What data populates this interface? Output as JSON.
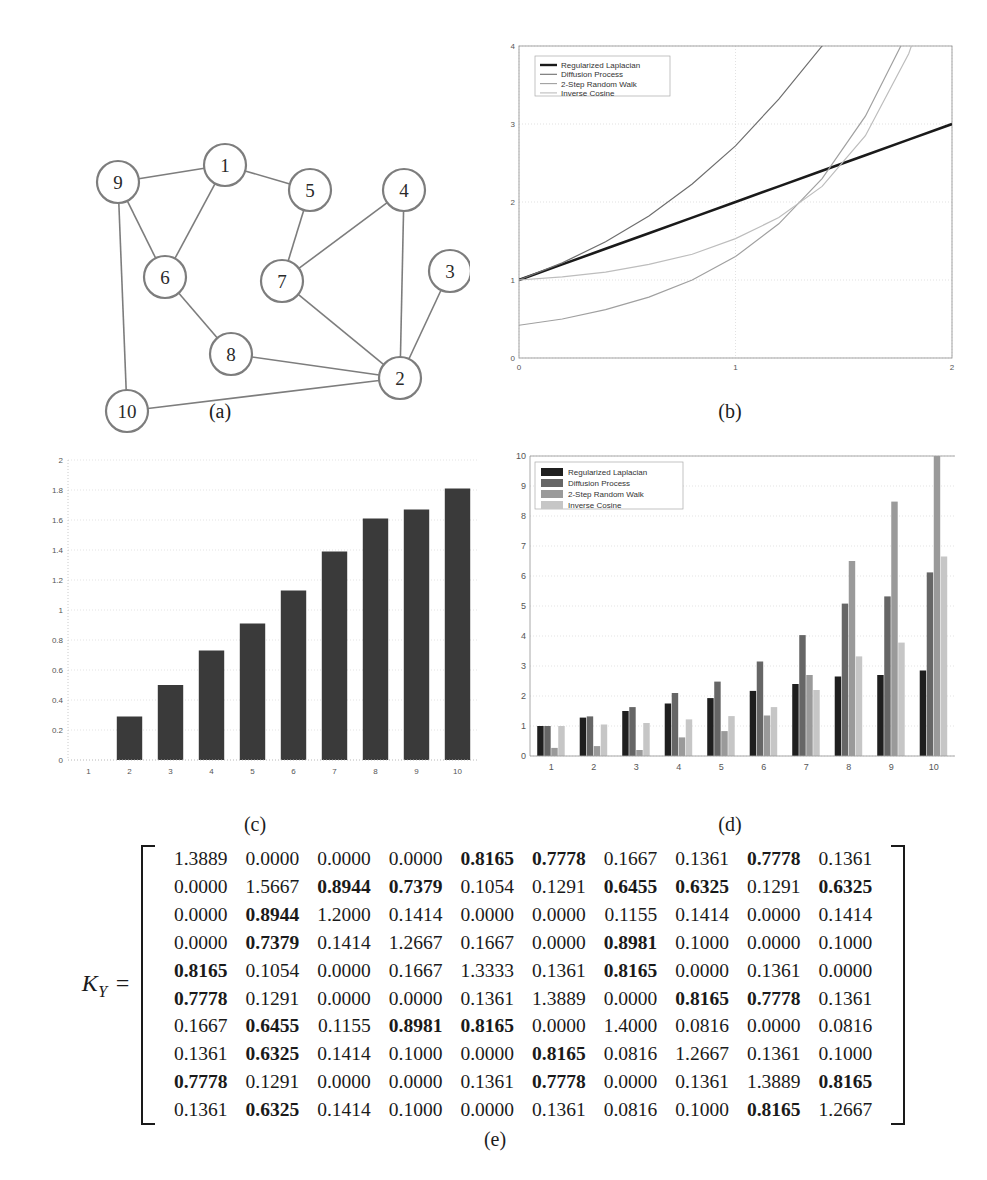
{
  "figure": {
    "captions": {
      "a": "(a)",
      "b": "(b)",
      "c": "(c)",
      "d": "(d)",
      "e": "(e)"
    }
  },
  "panel_a": {
    "title": "graph-diagram",
    "nodes": [
      {
        "id": "1",
        "x": 205,
        "y": 110
      },
      {
        "id": "2",
        "x": 380,
        "y": 323
      },
      {
        "id": "3",
        "x": 430,
        "y": 216
      },
      {
        "id": "4",
        "x": 384,
        "y": 135
      },
      {
        "id": "5",
        "x": 290,
        "y": 135
      },
      {
        "id": "6",
        "x": 145,
        "y": 222
      },
      {
        "id": "7",
        "x": 262,
        "y": 226
      },
      {
        "id": "8",
        "x": 211,
        "y": 299
      },
      {
        "id": "9",
        "x": 98,
        "y": 127
      },
      {
        "id": "10",
        "x": 107,
        "y": 356
      }
    ],
    "edges": [
      [
        "9",
        "1"
      ],
      [
        "9",
        "6"
      ],
      [
        "9",
        "10"
      ],
      [
        "1",
        "6"
      ],
      [
        "1",
        "5"
      ],
      [
        "5",
        "7"
      ],
      [
        "7",
        "4"
      ],
      [
        "7",
        "2"
      ],
      [
        "4",
        "2"
      ],
      [
        "3",
        "2"
      ],
      [
        "6",
        "8"
      ],
      [
        "8",
        "2"
      ],
      [
        "10",
        "2"
      ]
    ]
  },
  "panel_b": {
    "legend_title": "",
    "legend_position": "top-left",
    "chart_data": {
      "type": "line",
      "title": "",
      "xlabel": "",
      "ylabel": "",
      "xlim": [
        0,
        2
      ],
      "ylim": [
        0,
        4
      ],
      "xticks": [
        "0",
        "1",
        "2"
      ],
      "yticks": [
        "0",
        "1",
        "2",
        "3",
        "4"
      ],
      "grid": true,
      "x": [
        0,
        0.2,
        0.4,
        0.6,
        0.8,
        1.0,
        1.2,
        1.4,
        1.6,
        1.8,
        2.0
      ],
      "series": [
        {
          "name": "Regularized Laplacian",
          "color": "#1a1a1a",
          "values": [
            1.0,
            1.2,
            1.4,
            1.6,
            1.8,
            2.0,
            2.2,
            2.4,
            2.6,
            2.8,
            3.0
          ]
        },
        {
          "name": "Diffusion Process",
          "color": "#6e6e6e",
          "values": [
            1.0,
            1.22,
            1.49,
            1.82,
            2.23,
            2.72,
            3.32,
            4.0,
            4.9,
            6.0,
            7.4
          ]
        },
        {
          "name": "2-Step Random Walk",
          "color": "#a0a0a0",
          "values": [
            0.42,
            0.5,
            0.62,
            0.78,
            1.0,
            1.3,
            1.72,
            2.3,
            3.1,
            4.2,
            5.6
          ]
        },
        {
          "name": "Inverse Cosine",
          "color": "#bdbdbd",
          "values": [
            1.0,
            1.04,
            1.1,
            1.2,
            1.33,
            1.53,
            1.8,
            2.2,
            2.85,
            3.9,
            5.5
          ]
        }
      ]
    }
  },
  "panel_c": {
    "chart_data": {
      "type": "bar",
      "title": "",
      "xlabel": "",
      "ylabel": "",
      "bar_color": "#3a3a3a",
      "grid": true,
      "ylim": [
        0,
        2
      ],
      "yticks": [
        "0",
        "0.2",
        "0.4",
        "0.6",
        "0.8",
        "1",
        "1.2",
        "1.4",
        "1.6",
        "1.8",
        "2"
      ],
      "categories": [
        "1",
        "2",
        "3",
        "4",
        "5",
        "6",
        "7",
        "8",
        "9",
        "10"
      ],
      "values": [
        0,
        0.29,
        0.5,
        0.73,
        0.91,
        1.13,
        1.39,
        1.61,
        1.67,
        1.81
      ]
    }
  },
  "panel_d": {
    "chart_data": {
      "type": "bar",
      "title": "",
      "xlabel": "",
      "ylabel": "",
      "grid": true,
      "ylim": [
        0,
        10
      ],
      "yticks": [
        "0",
        "1",
        "2",
        "3",
        "4",
        "5",
        "6",
        "7",
        "8",
        "9",
        "10"
      ],
      "categories": [
        "1",
        "2",
        "3",
        "4",
        "5",
        "6",
        "7",
        "8",
        "9",
        "10"
      ],
      "legend_position": "top-left",
      "series": [
        {
          "name": "Regularized Laplacian",
          "color": "#1f1f1f",
          "values": [
            1.0,
            1.28,
            1.5,
            1.75,
            1.93,
            2.17,
            2.4,
            2.65,
            2.7,
            2.85
          ]
        },
        {
          "name": "Diffusion Process",
          "color": "#666666",
          "values": [
            1.0,
            1.32,
            1.63,
            2.1,
            2.48,
            3.15,
            4.03,
            5.08,
            5.32,
            6.12
          ]
        },
        {
          "name": "2-Step Random Walk",
          "color": "#9a9a9a",
          "values": [
            0.27,
            0.33,
            0.2,
            0.62,
            0.83,
            1.35,
            2.7,
            6.5,
            8.48,
            10.0
          ]
        },
        {
          "name": "Inverse Cosine",
          "color": "#c6c6c6",
          "values": [
            1.0,
            1.05,
            1.1,
            1.22,
            1.33,
            1.63,
            2.2,
            3.32,
            3.78,
            6.65
          ]
        }
      ]
    }
  },
  "panel_e": {
    "label": "K",
    "label_sub": "Y",
    "equals": "=",
    "matrix": [
      [
        {
          "v": "1.3889",
          "b": false
        },
        {
          "v": "0.0000",
          "b": false
        },
        {
          "v": "0.0000",
          "b": false
        },
        {
          "v": "0.0000",
          "b": false
        },
        {
          "v": "0.8165",
          "b": true
        },
        {
          "v": "0.7778",
          "b": true
        },
        {
          "v": "0.1667",
          "b": false
        },
        {
          "v": "0.1361",
          "b": false
        },
        {
          "v": "0.7778",
          "b": true
        },
        {
          "v": "0.1361",
          "b": false
        }
      ],
      [
        {
          "v": "0.0000",
          "b": false
        },
        {
          "v": "1.5667",
          "b": false
        },
        {
          "v": "0.8944",
          "b": true
        },
        {
          "v": "0.7379",
          "b": true
        },
        {
          "v": "0.1054",
          "b": false
        },
        {
          "v": "0.1291",
          "b": false
        },
        {
          "v": "0.6455",
          "b": true
        },
        {
          "v": "0.6325",
          "b": true
        },
        {
          "v": "0.1291",
          "b": false
        },
        {
          "v": "0.6325",
          "b": true
        }
      ],
      [
        {
          "v": "0.0000",
          "b": false
        },
        {
          "v": "0.8944",
          "b": true
        },
        {
          "v": "1.2000",
          "b": false
        },
        {
          "v": "0.1414",
          "b": false
        },
        {
          "v": "0.0000",
          "b": false
        },
        {
          "v": "0.0000",
          "b": false
        },
        {
          "v": "0.1155",
          "b": false
        },
        {
          "v": "0.1414",
          "b": false
        },
        {
          "v": "0.0000",
          "b": false
        },
        {
          "v": "0.1414",
          "b": false
        }
      ],
      [
        {
          "v": "0.0000",
          "b": false
        },
        {
          "v": "0.7379",
          "b": true
        },
        {
          "v": "0.1414",
          "b": false
        },
        {
          "v": "1.2667",
          "b": false
        },
        {
          "v": "0.1667",
          "b": false
        },
        {
          "v": "0.0000",
          "b": false
        },
        {
          "v": "0.8981",
          "b": true
        },
        {
          "v": "0.1000",
          "b": false
        },
        {
          "v": "0.0000",
          "b": false
        },
        {
          "v": "0.1000",
          "b": false
        }
      ],
      [
        {
          "v": "0.8165",
          "b": true
        },
        {
          "v": "0.1054",
          "b": false
        },
        {
          "v": "0.0000",
          "b": false
        },
        {
          "v": "0.1667",
          "b": false
        },
        {
          "v": "1.3333",
          "b": false
        },
        {
          "v": "0.1361",
          "b": false
        },
        {
          "v": "0.8165",
          "b": true
        },
        {
          "v": "0.0000",
          "b": false
        },
        {
          "v": "0.1361",
          "b": false
        },
        {
          "v": "0.0000",
          "b": false
        }
      ],
      [
        {
          "v": "0.7778",
          "b": true
        },
        {
          "v": "0.1291",
          "b": false
        },
        {
          "v": "0.0000",
          "b": false
        },
        {
          "v": "0.0000",
          "b": false
        },
        {
          "v": "0.1361",
          "b": false
        },
        {
          "v": "1.3889",
          "b": false
        },
        {
          "v": "0.0000",
          "b": false
        },
        {
          "v": "0.8165",
          "b": true
        },
        {
          "v": "0.7778",
          "b": true
        },
        {
          "v": "0.1361",
          "b": false
        }
      ],
      [
        {
          "v": "0.1667",
          "b": false
        },
        {
          "v": "0.6455",
          "b": true
        },
        {
          "v": "0.1155",
          "b": false
        },
        {
          "v": "0.8981",
          "b": true
        },
        {
          "v": "0.8165",
          "b": true
        },
        {
          "v": "0.0000",
          "b": false
        },
        {
          "v": "1.4000",
          "b": false
        },
        {
          "v": "0.0816",
          "b": false
        },
        {
          "v": "0.0000",
          "b": false
        },
        {
          "v": "0.0816",
          "b": false
        }
      ],
      [
        {
          "v": "0.1361",
          "b": false
        },
        {
          "v": "0.6325",
          "b": true
        },
        {
          "v": "0.1414",
          "b": false
        },
        {
          "v": "0.1000",
          "b": false
        },
        {
          "v": "0.0000",
          "b": false
        },
        {
          "v": "0.8165",
          "b": true
        },
        {
          "v": "0.0816",
          "b": false
        },
        {
          "v": "1.2667",
          "b": false
        },
        {
          "v": "0.1361",
          "b": false
        },
        {
          "v": "0.1000",
          "b": false
        }
      ],
      [
        {
          "v": "0.7778",
          "b": true
        },
        {
          "v": "0.1291",
          "b": false
        },
        {
          "v": "0.0000",
          "b": false
        },
        {
          "v": "0.0000",
          "b": false
        },
        {
          "v": "0.1361",
          "b": false
        },
        {
          "v": "0.7778",
          "b": true
        },
        {
          "v": "0.0000",
          "b": false
        },
        {
          "v": "0.1361",
          "b": false
        },
        {
          "v": "1.3889",
          "b": false
        },
        {
          "v": "0.8165",
          "b": true
        }
      ],
      [
        {
          "v": "0.1361",
          "b": false
        },
        {
          "v": "0.6325",
          "b": true
        },
        {
          "v": "0.1414",
          "b": false
        },
        {
          "v": "0.1000",
          "b": false
        },
        {
          "v": "0.0000",
          "b": false
        },
        {
          "v": "0.1361",
          "b": false
        },
        {
          "v": "0.0816",
          "b": false
        },
        {
          "v": "0.1000",
          "b": false
        },
        {
          "v": "0.8165",
          "b": true
        },
        {
          "v": "1.2667",
          "b": false
        }
      ]
    ]
  }
}
